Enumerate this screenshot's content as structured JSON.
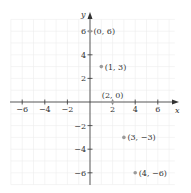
{
  "chart_data": {
    "type": "scatter",
    "title": "",
    "xlabel": "x",
    "ylabel": "y",
    "xlim": [
      -7,
      8
    ],
    "ylim": [
      -7,
      7
    ],
    "grid": true,
    "x_ticks": [
      -6,
      -4,
      -2,
      2,
      4,
      6
    ],
    "y_ticks": [
      -6,
      -4,
      -2,
      2,
      4,
      6
    ],
    "x_tick_labels": [
      "−6",
      "−4",
      "−2",
      "2",
      "4",
      "6"
    ],
    "y_tick_labels": [
      "−6",
      "−4",
      "−2",
      "2",
      "4",
      "6"
    ],
    "points": [
      {
        "x": 0,
        "y": 6,
        "label": "(0, 6)"
      },
      {
        "x": 1,
        "y": 3,
        "label": "(1, 3)"
      },
      {
        "x": 2,
        "y": 0,
        "label": "(2, 0)"
      },
      {
        "x": 3,
        "y": -3,
        "label": "(3, −3)"
      },
      {
        "x": 4,
        "y": -6,
        "label": "(4, −6)"
      }
    ],
    "colors": {
      "axis": "#333333",
      "grid": "#ececec",
      "point": "#9a9a9a"
    }
  }
}
